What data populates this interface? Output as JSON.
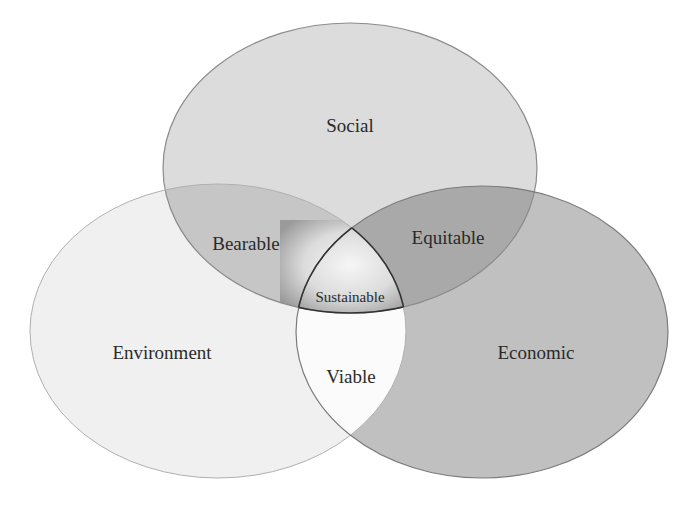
{
  "diagram": {
    "type": "venn-3",
    "sets": [
      {
        "id": "social",
        "label": "Social",
        "fill": "#dcdcdc",
        "stroke": "#8c8c8c"
      },
      {
        "id": "environment",
        "label": "Environment",
        "fill": "#f0f0f0",
        "stroke": "#a8a8a8"
      },
      {
        "id": "economic",
        "label": "Economic",
        "fill": "#c0c0c0",
        "stroke": "#7c7c7c"
      }
    ],
    "intersections": [
      {
        "id": "bearable",
        "sets": [
          "social",
          "environment"
        ],
        "label": "Bearable",
        "fill": "#c6c6c6"
      },
      {
        "id": "equitable",
        "sets": [
          "social",
          "economic"
        ],
        "label": "Equitable",
        "fill": "#a9a9a9"
      },
      {
        "id": "viable",
        "sets": [
          "environment",
          "economic"
        ],
        "label": "Viable",
        "fill": "#fbfbfb"
      },
      {
        "id": "sustainable",
        "sets": [
          "social",
          "environment",
          "economic"
        ],
        "label": "Sustainable",
        "fill_center": "#f4f4f4",
        "fill_edge": "#a0a0a0",
        "stroke": "#333333"
      }
    ]
  }
}
